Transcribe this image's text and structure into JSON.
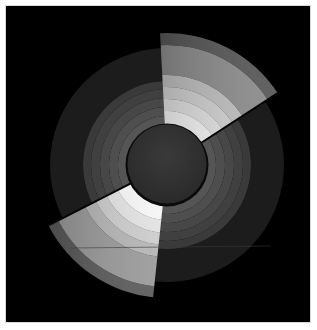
{
  "chart_data": {
    "type": "polar-area",
    "title": "",
    "subtitle": "",
    "xlabel": "",
    "ylabel": "",
    "legend": [],
    "grid": false,
    "center": {
      "x": 167,
      "y": 165
    },
    "background": "#000000",
    "hub": {
      "radius": 40,
      "fill": "#333333",
      "rim": "#0a0a0a"
    },
    "base_rings": [
      {
        "r_inner": 84,
        "r_outer": 117,
        "fill": "#1c1c1c"
      },
      {
        "r_inner": 76,
        "r_outer": 84,
        "fill": "#3a3a3a"
      },
      {
        "r_inner": 67,
        "r_outer": 76,
        "fill": "#404040"
      },
      {
        "r_inner": 58,
        "r_outer": 67,
        "fill": "#474747"
      },
      {
        "r_inner": 49,
        "r_outer": 58,
        "fill": "#4e4e4e"
      },
      {
        "r_inner": 40,
        "r_outer": 49,
        "fill": "#555555"
      }
    ],
    "highlighted_sectors": [
      {
        "name": "sector-top",
        "start_angle_deg": -3,
        "end_angle_deg": 57,
        "r_inner": 40,
        "r_outer": 132,
        "bands": [
          {
            "r_inner": 120,
            "r_outer": 132,
            "fill": "#555555"
          },
          {
            "r_inner": 90,
            "r_outer": 120,
            "fill": "#8a8a8a"
          },
          {
            "r_inner": 78,
            "r_outer": 90,
            "fill": "#bdbdbd"
          },
          {
            "r_inner": 66,
            "r_outer": 78,
            "fill": "#cfcfcf"
          },
          {
            "r_inner": 54,
            "r_outer": 66,
            "fill": "#e0e0e0"
          },
          {
            "r_inner": 40,
            "r_outer": 54,
            "fill": "#f4f4f4"
          }
        ]
      },
      {
        "name": "sector-bottom",
        "start_angle_deg": 186,
        "end_angle_deg": 243,
        "r_inner": 40,
        "r_outer": 133,
        "bands": [
          {
            "r_inner": 122,
            "r_outer": 133,
            "fill": "#5a5a5a"
          },
          {
            "r_inner": 92,
            "r_outer": 122,
            "fill": "#9a9a9a"
          },
          {
            "r_inner": 80,
            "r_outer": 92,
            "fill": "#b5b5b5"
          },
          {
            "r_inner": 68,
            "r_outer": 80,
            "fill": "#cccccc"
          },
          {
            "r_inner": 55,
            "r_outer": 68,
            "fill": "#e2e2e2"
          },
          {
            "r_inner": 40,
            "r_outer": 55,
            "fill": "#f6f6f6"
          }
        ]
      }
    ],
    "artifact_line": {
      "y": 248,
      "x1": 70,
      "x2": 270,
      "color": "#3a3a3a"
    }
  }
}
